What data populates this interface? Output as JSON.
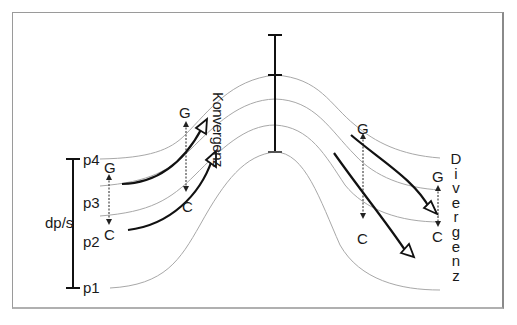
{
  "diagram": {
    "labels": {
      "konvergenz": "Konvergenz",
      "divergenz": "Divergenz",
      "dp_s": "dp/s",
      "p4": "p4",
      "p3": "p3",
      "p2": "p2",
      "p1": "p1"
    },
    "left_pair": {
      "g": "G",
      "c": "C"
    },
    "mid_left_pair": {
      "g": "G",
      "c": "C"
    },
    "mid_right_pair": {
      "g": "G",
      "c": "C"
    },
    "right_pair": {
      "g": "G",
      "c": "C"
    },
    "colors": {
      "isobar": "#a8a8a8",
      "arrow": "#111111",
      "frame": "#9a9a9a",
      "text": "#1a1a1a"
    }
  }
}
